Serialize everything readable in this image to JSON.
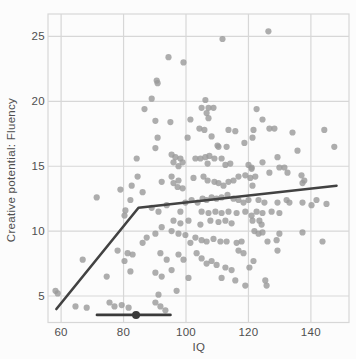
{
  "window": {
    "width": 356,
    "height": 359
  },
  "chart_data": {
    "type": "scatter",
    "title": "",
    "xlabel": "IQ",
    "ylabel": "Creative potential: Fluency",
    "x_ticks": [
      60,
      80,
      100,
      120,
      140
    ],
    "y_ticks": [
      5,
      10,
      15,
      20,
      25
    ],
    "xlim": [
      55.8,
      152.2
    ],
    "ylim": [
      2.96,
      26.73
    ],
    "grid": true,
    "legend": "none",
    "points": [
      [
        86.7,
        19.4
      ],
      [
        111.7,
        24.8
      ],
      [
        94.4,
        23.4
      ],
      [
        99.2,
        23.0
      ],
      [
        90.6,
        21.6
      ],
      [
        90.9,
        21.4
      ],
      [
        89.0,
        20.2
      ],
      [
        105.0,
        19.5
      ],
      [
        106.2,
        20.1
      ],
      [
        107.2,
        19.5
      ],
      [
        108.8,
        19.5
      ],
      [
        106.6,
        19.1
      ],
      [
        126.4,
        25.4
      ],
      [
        122.6,
        19.4
      ],
      [
        90.2,
        18.5
      ],
      [
        95.0,
        18.4
      ],
      [
        101.4,
        18.6
      ],
      [
        107.2,
        18.7
      ],
      [
        124.5,
        18.6
      ],
      [
        90.9,
        17.2
      ],
      [
        90.2,
        16.4
      ],
      [
        100.5,
        17.2
      ],
      [
        104.3,
        17.9
      ],
      [
        105.9,
        17.8
      ],
      [
        108.2,
        17.3
      ],
      [
        110.1,
        16.6
      ],
      [
        113.6,
        17.8
      ],
      [
        115.8,
        17.7
      ],
      [
        118.7,
        16.8
      ],
      [
        110.4,
        16.5
      ],
      [
        113.0,
        16.5
      ],
      [
        126.7,
        17.9
      ],
      [
        128.3,
        17.9
      ],
      [
        121.6,
        17.8
      ],
      [
        121.3,
        17.2
      ],
      [
        134.1,
        17.6
      ],
      [
        144.3,
        17.8
      ],
      [
        147.5,
        16.5
      ],
      [
        95.4,
        15.9
      ],
      [
        96.6,
        15.7
      ],
      [
        98.2,
        15.6
      ],
      [
        96.0,
        15.3
      ],
      [
        97.6,
        15.0
      ],
      [
        98.9,
        15.3
      ],
      [
        103.0,
        15.6
      ],
      [
        104.6,
        15.6
      ],
      [
        106.2,
        15.7
      ],
      [
        107.5,
        15.8
      ],
      [
        109.1,
        15.6
      ],
      [
        111.4,
        15.6
      ],
      [
        106.9,
        15.2
      ],
      [
        112.6,
        15.1
      ],
      [
        114.2,
        15.2
      ],
      [
        120.0,
        15.1
      ],
      [
        121.0,
        14.8
      ],
      [
        84.2,
        15.6
      ],
      [
        129.3,
        15.7
      ],
      [
        124.5,
        15.3
      ],
      [
        135.7,
        16.2
      ],
      [
        92.2,
        13.8
      ],
      [
        95.4,
        14.2
      ],
      [
        96.0,
        13.7
      ],
      [
        97.6,
        13.9
      ],
      [
        97.3,
        13.4
      ],
      [
        98.9,
        13.3
      ],
      [
        102.4,
        14.1
      ],
      [
        105.6,
        14.2
      ],
      [
        106.9,
        13.9
      ],
      [
        109.1,
        13.8
      ],
      [
        110.4,
        13.7
      ],
      [
        112.0,
        13.5
      ],
      [
        113.6,
        13.8
      ],
      [
        115.2,
        13.9
      ],
      [
        116.8,
        14.2
      ],
      [
        119.0,
        14.3
      ],
      [
        120.6,
        14.1
      ],
      [
        84.5,
        14.2
      ],
      [
        121.0,
        14.9
      ],
      [
        126.7,
        14.5
      ],
      [
        129.9,
        14.9
      ],
      [
        131.5,
        14.9
      ],
      [
        132.5,
        14.5
      ],
      [
        137.0,
        14.3
      ],
      [
        137.9,
        13.9
      ],
      [
        137.3,
        13.7
      ],
      [
        122.2,
        14.2
      ],
      [
        121.3,
        13.5
      ],
      [
        79.0,
        13.2
      ],
      [
        82.6,
        13.5
      ],
      [
        86.1,
        13.0
      ],
      [
        89.0,
        11.8
      ],
      [
        91.2,
        11.5
      ],
      [
        93.8,
        12.0
      ],
      [
        98.2,
        11.5
      ],
      [
        99.8,
        12.2
      ],
      [
        101.8,
        12.4
      ],
      [
        103.7,
        12.2
      ],
      [
        105.3,
        12.5
      ],
      [
        106.6,
        12.4
      ],
      [
        108.2,
        12.6
      ],
      [
        109.8,
        12.5
      ],
      [
        111.4,
        12.6
      ],
      [
        113.3,
        12.8
      ],
      [
        115.2,
        12.5
      ],
      [
        116.8,
        12.4
      ],
      [
        118.4,
        12.2
      ],
      [
        120.0,
        12.4
      ],
      [
        105.0,
        11.5
      ],
      [
        107.2,
        11.4
      ],
      [
        109.4,
        11.5
      ],
      [
        111.4,
        11.4
      ],
      [
        113.6,
        11.5
      ],
      [
        116.2,
        11.4
      ],
      [
        119.0,
        11.5
      ],
      [
        121.0,
        11.2
      ],
      [
        71.4,
        12.6
      ],
      [
        82.2,
        12.4
      ],
      [
        80.6,
        11.6
      ],
      [
        80.3,
        11.2
      ],
      [
        123.2,
        12.4
      ],
      [
        125.1,
        12.2
      ],
      [
        127.4,
        11.5
      ],
      [
        129.3,
        12.2
      ],
      [
        132.2,
        12.4
      ],
      [
        133.1,
        12.2
      ],
      [
        137.3,
        12.2
      ],
      [
        140.2,
        12.0
      ],
      [
        141.8,
        12.4
      ],
      [
        145.0,
        12.1
      ],
      [
        122.6,
        11.5
      ],
      [
        124.5,
        11.4
      ],
      [
        129.9,
        11.4
      ],
      [
        96.0,
        10.8
      ],
      [
        98.2,
        10.6
      ],
      [
        100.8,
        10.8
      ],
      [
        104.6,
        10.5
      ],
      [
        107.8,
        10.8
      ],
      [
        110.4,
        10.7
      ],
      [
        112.6,
        10.8
      ],
      [
        114.6,
        10.6
      ],
      [
        90.2,
        9.8
      ],
      [
        92.2,
        10.3
      ],
      [
        95.4,
        10.0
      ],
      [
        97.6,
        9.8
      ],
      [
        121.3,
        10.8
      ],
      [
        123.5,
        10.8
      ],
      [
        124.2,
        10.5
      ],
      [
        121.9,
        10.0
      ],
      [
        99.8,
        9.7
      ],
      [
        101.4,
        9.1
      ],
      [
        103.0,
        9.5
      ],
      [
        105.0,
        9.3
      ],
      [
        106.6,
        9.2
      ],
      [
        108.8,
        9.4
      ],
      [
        111.0,
        9.2
      ],
      [
        113.0,
        9.2
      ],
      [
        116.2,
        9.1
      ],
      [
        117.8,
        9.2
      ],
      [
        124.5,
        9.9
      ],
      [
        123.2,
        9.8
      ],
      [
        129.9,
        9.8
      ],
      [
        137.3,
        9.9
      ],
      [
        126.1,
        9.2
      ],
      [
        129.0,
        9.3
      ],
      [
        143.7,
        9.2
      ],
      [
        86.1,
        9.1
      ],
      [
        87.4,
        9.5
      ],
      [
        91.8,
        8.3
      ],
      [
        93.8,
        7.8
      ],
      [
        97.6,
        8.2
      ],
      [
        99.2,
        7.8
      ],
      [
        103.4,
        8.3
      ],
      [
        105.0,
        7.9
      ],
      [
        106.6,
        7.5
      ],
      [
        108.2,
        7.7
      ],
      [
        116.8,
        8.5
      ],
      [
        118.4,
        8.3
      ],
      [
        129.3,
        8.5
      ],
      [
        78.1,
        8.5
      ],
      [
        81.3,
        8.3
      ],
      [
        82.9,
        8.2
      ],
      [
        80.3,
        7.7
      ],
      [
        66.9,
        7.8
      ],
      [
        109.8,
        7.4
      ],
      [
        112.6,
        7.2
      ],
      [
        114.6,
        7.0
      ],
      [
        90.2,
        6.8
      ],
      [
        92.2,
        6.5
      ],
      [
        95.4,
        7.0
      ],
      [
        100.8,
        6.4
      ],
      [
        111.4,
        6.4
      ],
      [
        115.8,
        6.2
      ],
      [
        119.0,
        5.8
      ],
      [
        74.6,
        6.5
      ],
      [
        82.2,
        6.9
      ],
      [
        121.6,
        7.7
      ],
      [
        120.3,
        7.2
      ],
      [
        125.4,
        6.2
      ],
      [
        125.8,
        5.8
      ],
      [
        91.2,
        5.1
      ],
      [
        97.0,
        5.4
      ],
      [
        91.8,
        4.2
      ],
      [
        93.4,
        3.9
      ],
      [
        58.2,
        5.4
      ],
      [
        58.9,
        5.2
      ],
      [
        64.6,
        4.2
      ],
      [
        68.2,
        4.1
      ],
      [
        79.4,
        4.3
      ],
      [
        81.6,
        4.1
      ],
      [
        75.5,
        4.5
      ],
      [
        77.1,
        4.2
      ],
      [
        90.2,
        4.5
      ]
    ],
    "segmented_fit_line": {
      "description": "piecewise threshold regression",
      "points": [
        [
          58.5,
          4.0
        ],
        [
          84.8,
          11.8
        ],
        [
          148.2,
          13.5
        ]
      ]
    },
    "threshold_errorbar": {
      "y": 3.54,
      "x_low": 71.5,
      "x_center": 84.0,
      "x_high": 95.0
    }
  },
  "style": {
    "background": "#fcfcfc",
    "grid_color": "#d7d7d7",
    "point_color": "#999999",
    "point_opacity": 0.8,
    "fit_line_color": "#424242",
    "errorbar_color": "#3a3a3a",
    "text_color": "#4f4f4f"
  }
}
